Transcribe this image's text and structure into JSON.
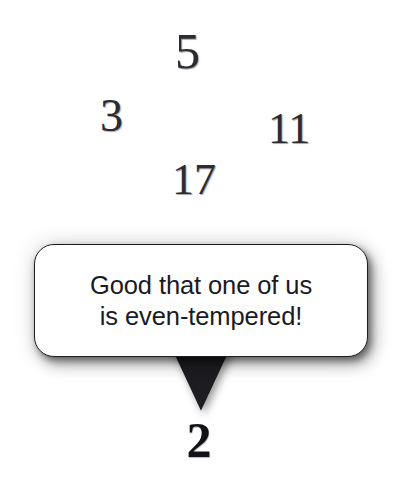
{
  "panel": {
    "kind": "comic-panel",
    "background_color": "#ffffff",
    "ink_color": "#1d1d21"
  },
  "primes": [
    {
      "value": "5",
      "name": "prime-number-5"
    },
    {
      "value": "3",
      "name": "prime-number-3"
    },
    {
      "value": "11",
      "name": "prime-number-11"
    },
    {
      "value": "17",
      "name": "prime-number-17"
    }
  ],
  "speaker": {
    "value": "2",
    "label": "number-two"
  },
  "speech_bubble": {
    "line1": "Good that one of us",
    "line2": "is even-tempered!",
    "full_text": "Good that one of us is even-tempered!",
    "fill_color": "#ffffff",
    "border_color": "#1d1d21"
  }
}
